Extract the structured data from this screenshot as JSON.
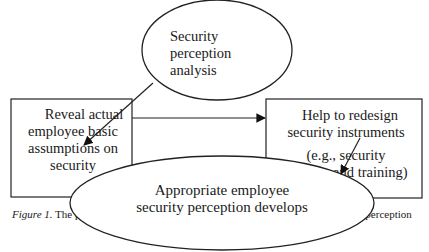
{
  "diagram": {
    "nodes": {
      "top_ellipse": {
        "label_lines": [
          "Security",
          "perception",
          "analysis"
        ]
      },
      "left_box": {
        "label_lines": [
          "Reveal actual",
          "employee basic",
          "assumptions on",
          "security"
        ]
      },
      "right_box": {
        "label_lines": [
          "Help to redesign",
          "security instruments",
          "(e.g., security",
          "policies and training)"
        ]
      },
      "bottom_ellipse": {
        "label_lines": [
          "Appropriate employee",
          "security perception develops"
        ]
      }
    },
    "edges": [
      {
        "from": "top_ellipse",
        "to": "left_box"
      },
      {
        "from": "left_box",
        "to": "right_box"
      },
      {
        "from": "right_box",
        "to": "bottom_ellipse"
      }
    ]
  },
  "caption": {
    "figure_label": "Figure 1.",
    "text_left": " The p",
    "text_right": "ity perception"
  }
}
